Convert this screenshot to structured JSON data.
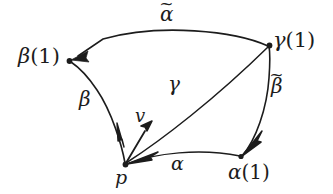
{
  "figure": {
    "background_color": "#ffffff",
    "stroke_color": "#1c1c1c",
    "width": 333,
    "height": 194,
    "vertices": [
      {
        "name": "p",
        "label": "p",
        "x": 125,
        "y": 165
      },
      {
        "name": "beta-1",
        "label": "β(1)",
        "x": 69,
        "y": 61
      },
      {
        "name": "gamma-1",
        "label": "γ(1)",
        "x": 270,
        "y": 45
      },
      {
        "name": "alpha-1",
        "label": "α(1)",
        "x": 241,
        "y": 157
      }
    ],
    "labels": {
      "beta_one": {
        "greek": "β",
        "paren": "(1)"
      },
      "gamma_one": {
        "greek": "γ",
        "paren": "(1)"
      },
      "alpha_one": {
        "greek": "α",
        "paren": "(1)"
      },
      "alpha_tilde": {
        "greek": "α",
        "tilde": "~"
      },
      "beta_tilde": {
        "greek": "β",
        "tilde": "~"
      },
      "gamma": "γ",
      "beta": "β",
      "alpha": "α",
      "v": "v",
      "p": "p"
    },
    "curves": [
      {
        "name": "alpha-tilde-curve",
        "from": "gamma-1",
        "to": "beta-1",
        "arrow_at": "beta-1",
        "label": "α̃"
      },
      {
        "name": "beta-curve",
        "from": "p",
        "to": "beta-1",
        "arrow_at": "p",
        "label": "β"
      },
      {
        "name": "gamma-curve",
        "from": "p",
        "to": "gamma-1",
        "arrow_at": "p",
        "label": "γ"
      },
      {
        "name": "alpha-curve",
        "from": "p",
        "to": "alpha-1",
        "arrow_at": "p",
        "label": "α"
      },
      {
        "name": "beta-tilde-curve",
        "from": "alpha-1",
        "to": "gamma-1",
        "arrow_at": "alpha-1",
        "label": "β̃"
      }
    ],
    "vectors": [
      {
        "name": "tangent-vector-v",
        "at": "p",
        "label": "v"
      }
    ]
  }
}
